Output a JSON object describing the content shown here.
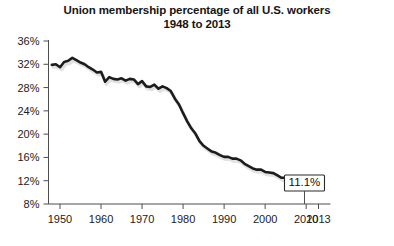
{
  "chart_data": {
    "type": "line",
    "title": "Union membership percentage of all U.S. workers",
    "subtitle": "1948 to 2013",
    "xlabel": "",
    "ylabel": "",
    "xlim": [
      1948,
      2013
    ],
    "ylim": [
      8,
      36
    ],
    "grid": false,
    "legend": null,
    "y_ticks": [
      "8%",
      "12%",
      "16%",
      "20%",
      "24%",
      "28%",
      "32%",
      "36%"
    ],
    "y_tick_values": [
      8,
      12,
      16,
      20,
      24,
      28,
      32,
      36
    ],
    "x_ticks": [
      "1950",
      "1960",
      "1970",
      "1980",
      "1990",
      "2000",
      "2010",
      "2013"
    ],
    "x_tick_values": [
      1950,
      1960,
      1970,
      1980,
      1990,
      2000,
      2010,
      2013
    ],
    "annotations": [
      {
        "label": "11.1%",
        "x": 2013,
        "y": 11.1
      }
    ],
    "x": [
      1948,
      1949,
      1950,
      1951,
      1952,
      1953,
      1954,
      1955,
      1956,
      1957,
      1958,
      1959,
      1960,
      1961,
      1962,
      1963,
      1964,
      1965,
      1966,
      1967,
      1968,
      1969,
      1970,
      1971,
      1972,
      1973,
      1974,
      1975,
      1976,
      1977,
      1978,
      1979,
      1980,
      1981,
      1982,
      1983,
      1984,
      1985,
      1986,
      1987,
      1988,
      1989,
      1990,
      1991,
      1992,
      1993,
      1994,
      1995,
      1996,
      1997,
      1998,
      1999,
      2000,
      2001,
      2002,
      2003,
      2004,
      2005,
      2006,
      2007,
      2008,
      2009,
      2010,
      2011,
      2012,
      2013
    ],
    "values": [
      31.9,
      32.0,
      31.5,
      32.4,
      32.6,
      33.1,
      32.7,
      32.3,
      32.0,
      31.5,
      31.1,
      30.6,
      30.7,
      29.0,
      29.8,
      29.5,
      29.4,
      29.6,
      29.2,
      29.5,
      29.4,
      28.6,
      29.1,
      28.2,
      28.1,
      28.5,
      27.8,
      28.2,
      27.9,
      27.4,
      26.1,
      25.1,
      23.6,
      22.2,
      21.0,
      20.1,
      18.8,
      18.0,
      17.5,
      17.0,
      16.8,
      16.4,
      16.1,
      16.1,
      15.8,
      15.8,
      15.5,
      14.9,
      14.5,
      14.1,
      13.9,
      13.9,
      13.5,
      13.4,
      13.3,
      12.9,
      12.5,
      12.5,
      12.0,
      12.1,
      12.4,
      12.3,
      11.9,
      11.8,
      11.3,
      11.1
    ]
  },
  "callout": {
    "text": "11.1%"
  }
}
